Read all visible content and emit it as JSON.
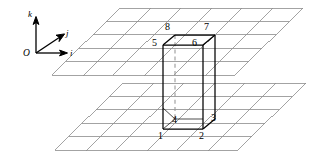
{
  "figure": {
    "colors": {
      "grid_line": "#8c8c8c",
      "box_line": "#000000",
      "hidden_line": "#9a9a9a",
      "background": "#ffffff",
      "text": "#000000"
    }
  },
  "axes": {
    "origin_label": "O",
    "i_label": "i",
    "j_label": "j",
    "k_label": "k"
  },
  "vertices": {
    "v1": "1",
    "v2": "2",
    "v3": "3",
    "v4": "4",
    "v5": "5",
    "v6": "6",
    "v7": "7",
    "v8": "8"
  },
  "planes": {
    "top_label": "upper grid plane",
    "bottom_label": "lower grid plane",
    "columns": 6,
    "rows": 5
  }
}
